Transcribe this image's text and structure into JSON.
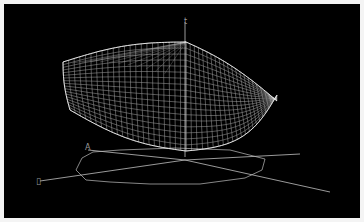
{
  "figure": {
    "type": "3d-wireframe-surface",
    "background": "#000000",
    "frame_color": "#f4f4f4",
    "mesh_color": "#d8d8d8",
    "axis_color": "#bdbdbd",
    "axes": {
      "z_label": "t",
      "x_label": "A",
      "y_label": "▯"
    }
  }
}
